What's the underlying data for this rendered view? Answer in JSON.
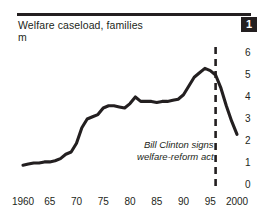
{
  "header": {
    "title": "Welfare caseload, families",
    "unit": "m",
    "badge": "1"
  },
  "annotation": {
    "line1": "Bill Clinton signs",
    "line2": "welfare-reform act"
  },
  "colors": {
    "ink": "#231f20",
    "background": "#ffffff",
    "badge_bg": "#231f20",
    "badge_text": "#ffffff"
  },
  "chart_data": {
    "type": "line",
    "title": "Welfare caseload, families",
    "subtitle": "m",
    "xlabel": "",
    "ylabel": "m",
    "xlim": [
      1960,
      2000
    ],
    "ylim": [
      0,
      6
    ],
    "grid": false,
    "legend": null,
    "y_ticks": [
      6,
      5,
      4,
      3,
      2,
      1,
      0
    ],
    "y_tick_labels": [
      "6",
      "5",
      "4",
      "3",
      "2",
      "1",
      "0"
    ],
    "x_ticks": [
      1960,
      1965,
      1970,
      1975,
      1980,
      1985,
      1990,
      1995,
      2000
    ],
    "x_tick_labels": [
      "1960",
      "65",
      "70",
      "75",
      "80",
      "85",
      "90",
      "95",
      "2000"
    ],
    "series": [
      {
        "name": "Welfare caseload, families (m)",
        "x": [
          1960,
          1961,
          1962,
          1963,
          1964,
          1965,
          1966,
          1967,
          1968,
          1969,
          1970,
          1971,
          1972,
          1973,
          1974,
          1975,
          1976,
          1977,
          1978,
          1979,
          1980,
          1981,
          1982,
          1983,
          1984,
          1985,
          1986,
          1987,
          1988,
          1989,
          1990,
          1991,
          1992,
          1993,
          1994,
          1995,
          1996,
          1997,
          1998,
          1999,
          2000
        ],
        "values": [
          0.9,
          0.95,
          1.0,
          1.0,
          1.05,
          1.05,
          1.1,
          1.2,
          1.4,
          1.5,
          1.9,
          2.6,
          3.0,
          3.1,
          3.2,
          3.5,
          3.6,
          3.6,
          3.55,
          3.5,
          3.7,
          4.0,
          3.8,
          3.8,
          3.8,
          3.75,
          3.8,
          3.8,
          3.85,
          3.9,
          4.1,
          4.5,
          4.9,
          5.1,
          5.3,
          5.2,
          5.0,
          4.4,
          3.6,
          2.9,
          2.3
        ]
      }
    ],
    "annotations": [
      {
        "type": "vline",
        "x": 1996,
        "style": "dashed",
        "label": "Bill Clinton signs welfare-reform act"
      }
    ]
  }
}
